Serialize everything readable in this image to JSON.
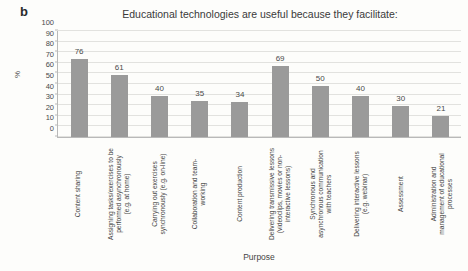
{
  "panel": {
    "label": "b"
  },
  "chart_data": {
    "type": "bar",
    "title": "Educational technologies are useful because they facilitate:",
    "xlabel": "Purpose",
    "ylabel": "%",
    "ylim": [
      0,
      100
    ],
    "yticks": [
      0,
      10,
      20,
      30,
      40,
      50,
      60,
      70,
      80,
      90,
      100
    ],
    "grid": true,
    "legend": null,
    "bar_color": "#9a9a9a",
    "categories": [
      "Content sharing",
      "Assigning tasks/exercises to be performed asynchronously (e.g. at home)",
      "Carrying out exercises synchronously (e.g. on-line)",
      "Collaboration and team-working",
      "Content production",
      "Delivering transmissive lessons (videoclips, movies or non-interactive lessons)",
      "Synchronous and asynchronous communication with teachers",
      "Delivering interactive lessons (e.g. webinar)",
      "Assessment",
      "Administration and management of educational processes"
    ],
    "category_lines": [
      "Content sharing",
      "Assigning tasks/exercises to be\nperformed asynchronously\n(e.g. at home)",
      "Carrying out exercises\nsynchronously (e.g. on-line)",
      "Collaboration and team-\nworking",
      "Content production",
      "Delivering transmissive lessons\n(videoclips, movies or non-\ninteractive lessons)",
      "Synchronous and\nasynchronous communication\nwith teachers",
      "Delivering interactive lessons\n(e.g. webinar)",
      "Assessment",
      "Administration and\nmanagement of educational\nprocesses"
    ],
    "values": [
      76,
      61,
      40,
      35,
      34,
      69,
      50,
      40,
      30,
      21
    ],
    "value_labels": [
      "76",
      "61",
      "40",
      "35",
      "34",
      "69",
      "50",
      "40",
      "30",
      "21"
    ]
  }
}
